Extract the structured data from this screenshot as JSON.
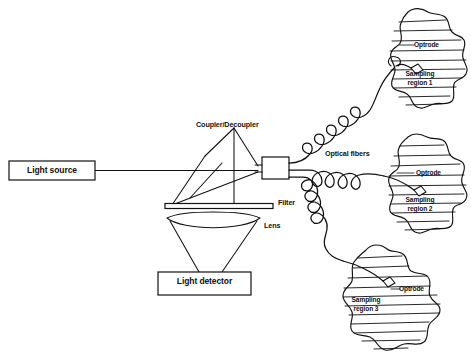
{
  "figure": {
    "domain": "diagram",
    "type": "schematic",
    "title_fragment_top": "",
    "background_color": "#ffffff",
    "ink_color": "#111111",
    "width": 471,
    "height": 362
  },
  "components": {
    "light_source": {
      "label": "Light source",
      "shape": "rectangle"
    },
    "light_detector": {
      "label": "Light detector",
      "shape": "rectangle"
    },
    "coupler": {
      "label": "Coupler/Decoupler",
      "shape": "triangle-beamsplitter"
    },
    "filter": {
      "label": "Filter",
      "shape": "thin-bar"
    },
    "lens": {
      "label": "Lens",
      "shape": "biconvex-lens"
    },
    "coupler_body": {
      "label": "",
      "shape": "small-rectangle"
    },
    "optical_fibers": {
      "label": "Optical fibers",
      "shape": "coiled-lines"
    }
  },
  "sampling_regions": [
    {
      "id": 1,
      "region_label": "Sampling\nregion 1",
      "optrode_label": "Optrode",
      "position": "top-right"
    },
    {
      "id": 2,
      "region_label": "Sampling\nregion 2",
      "optrode_label": "Optrode",
      "position": "middle-right"
    },
    {
      "id": 3,
      "region_label": "Sampling\nregion 3",
      "optrode_label": "Optrode",
      "position": "bottom-center-right"
    }
  ],
  "labels": {
    "light_source": "Light source",
    "light_detector": "Light detector",
    "coupler_decoupler": "Coupler/Decoupler",
    "filter": "Filter",
    "lens": "Lens",
    "optical_fibers": "Optical fibers",
    "optrode_1": "Optrode",
    "sampling_region_1_line1": "Sampling",
    "sampling_region_1_line2": "region 1",
    "optrode_2": "Optrode",
    "sampling_region_2_line1": "Sampling",
    "sampling_region_2_line2": "region 2",
    "optrode_3": "Optrode",
    "sampling_region_3_line1": "Sampling",
    "sampling_region_3_line2": "region 3"
  }
}
